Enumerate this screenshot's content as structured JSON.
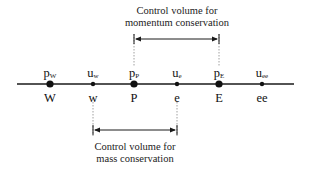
{
  "top_caption": {
    "line1": "Control volume for",
    "line2": "momentum conservation"
  },
  "bottom_caption": {
    "line1": "Control volume for",
    "line2": "mass conservation"
  },
  "nodes": [
    {
      "var": "p",
      "sub": "W",
      "name": "W",
      "x": 50,
      "size": "large"
    },
    {
      "var": "u",
      "sub": "w",
      "name": "w",
      "x": 93,
      "size": "small"
    },
    {
      "var": "p",
      "sub": "P",
      "name": "P",
      "x": 134,
      "size": "large"
    },
    {
      "var": "u",
      "sub": "e",
      "name": "e",
      "x": 177,
      "size": "small"
    },
    {
      "var": "p",
      "sub": "E",
      "name": "E",
      "x": 219,
      "size": "large"
    },
    {
      "var": "u",
      "sub": "ee",
      "name": "ee",
      "x": 262,
      "size": "small"
    }
  ],
  "colors": {
    "line": "#1a1a1a",
    "dashed": "#888888"
  }
}
